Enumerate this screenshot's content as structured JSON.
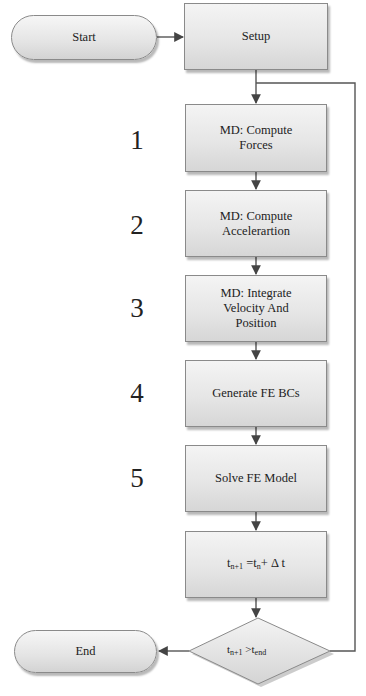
{
  "diagram": {
    "type": "flowchart",
    "colors": {
      "line": "#555555",
      "box_border": "#8a8a8a",
      "box_fill_top": "#f4f4f4",
      "box_fill_bottom": "#d6d6d6",
      "text": "#222222"
    },
    "nodes": {
      "start": {
        "shape": "terminal",
        "label": "Start"
      },
      "setup": {
        "shape": "process",
        "label": "Setup"
      },
      "step1": {
        "shape": "process",
        "number": "1",
        "label": "MD: Compute\nForces"
      },
      "step2": {
        "shape": "process",
        "number": "2",
        "label": "MD: Compute\nAccelerartion"
      },
      "step3": {
        "shape": "process",
        "number": "3",
        "label": "MD: Integrate\nVelocity And\nPosition"
      },
      "step4": {
        "shape": "process",
        "number": "4",
        "label": "Generate FE BCs"
      },
      "step5": {
        "shape": "process",
        "number": "5",
        "label": "Solve FE Model"
      },
      "update": {
        "shape": "process",
        "label": "t_{n+1} = t_n + Δt",
        "parts": {
          "t1": "t",
          "s1": "n+1",
          "eq": " =t",
          "s2": "n",
          "rest": "+ Δ t"
        }
      },
      "decision": {
        "shape": "decision",
        "label": "t_{n+1} > t_end",
        "parts": {
          "t1": "t",
          "s1": "n+1",
          "op": " >t",
          "s2": "end"
        }
      },
      "end": {
        "shape": "terminal",
        "label": "End"
      }
    },
    "edges": [
      {
        "from": "start",
        "to": "setup"
      },
      {
        "from": "setup",
        "to": "step1"
      },
      {
        "from": "step1",
        "to": "step2"
      },
      {
        "from": "step2",
        "to": "step3"
      },
      {
        "from": "step3",
        "to": "step4"
      },
      {
        "from": "step4",
        "to": "step5"
      },
      {
        "from": "step5",
        "to": "update"
      },
      {
        "from": "update",
        "to": "decision"
      },
      {
        "from": "decision",
        "to": "end",
        "condition": "true"
      },
      {
        "from": "decision",
        "to": "step1",
        "condition": "false (loop back)"
      }
    ]
  }
}
